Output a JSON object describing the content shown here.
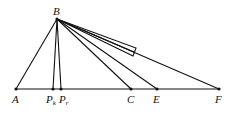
{
  "diagram": {
    "points": {
      "B": {
        "label": "B",
        "x": 57,
        "y": 19
      },
      "A": {
        "label": "A",
        "x": 16,
        "y": 89
      },
      "Pk": {
        "label": "P",
        "sub": "k",
        "x": 53,
        "y": 89
      },
      "Pr": {
        "label": "P",
        "sub": "r",
        "x": 61,
        "y": 89
      },
      "C": {
        "label": "C",
        "x": 131,
        "y": 89
      },
      "E": {
        "label": "E",
        "x": 157,
        "y": 89
      },
      "F": {
        "label": "F",
        "x": 219,
        "y": 89
      }
    },
    "segments": [
      "B-A",
      "B-Pk",
      "B-Pr",
      "B-C",
      "B-E",
      "B-F",
      "A-F"
    ],
    "right_angle_marker": "rectangle on ray from B near x=115-136"
  }
}
